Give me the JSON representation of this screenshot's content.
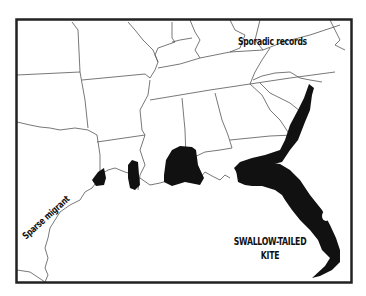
{
  "map": {
    "title_line1": "SWALLOW-TAILED",
    "title_line2": "KITE",
    "annotations": {
      "sporadic": "Sporadic records",
      "sparse": "Sparse migrant"
    },
    "colors": {
      "range_fill": "#111111",
      "border": "#222222",
      "state_lines": "#555555",
      "background": "#ffffff"
    }
  }
}
